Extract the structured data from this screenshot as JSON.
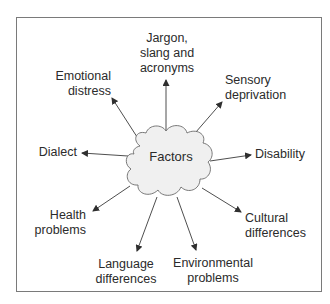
{
  "diagram": {
    "type": "radial-concept-map",
    "center": {
      "label": "Factors",
      "fill": "#f0f0f0",
      "stroke": "#6a6a6a"
    },
    "nodes": [
      {
        "id": "jargon",
        "lines": [
          "Jargon,",
          "slang and",
          "acronyms"
        ]
      },
      {
        "id": "emotional",
        "lines": [
          "Emotional",
          "distress"
        ]
      },
      {
        "id": "sensory",
        "lines": [
          "Sensory",
          "deprivation"
        ]
      },
      {
        "id": "dialect",
        "lines": [
          "Dialect"
        ]
      },
      {
        "id": "disability",
        "lines": [
          "Disability"
        ]
      },
      {
        "id": "health",
        "lines": [
          "Health",
          "problems"
        ]
      },
      {
        "id": "cultural",
        "lines": [
          "Cultural",
          "differences"
        ]
      },
      {
        "id": "language",
        "lines": [
          "Language",
          "differences"
        ]
      },
      {
        "id": "environmental",
        "lines": [
          "Environmental",
          "problems"
        ]
      }
    ],
    "edges": [
      {
        "from": "Factors",
        "to": "Jargon, slang and acronyms"
      },
      {
        "from": "Factors",
        "to": "Emotional distress"
      },
      {
        "from": "Factors",
        "to": "Sensory deprivation"
      },
      {
        "from": "Factors",
        "to": "Dialect"
      },
      {
        "from": "Factors",
        "to": "Disability"
      },
      {
        "from": "Factors",
        "to": "Health problems"
      },
      {
        "from": "Factors",
        "to": "Cultural differences"
      },
      {
        "from": "Factors",
        "to": "Language differences"
      },
      {
        "from": "Factors",
        "to": "Environmental problems"
      }
    ],
    "colors": {
      "frame": "#7a7a7a",
      "arrow": "#3a3a3a",
      "text": "#2b2b2b"
    }
  }
}
